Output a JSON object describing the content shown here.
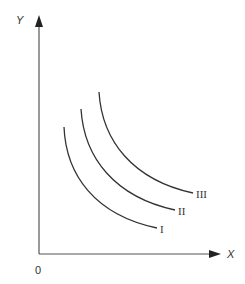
{
  "diagram": {
    "type": "indifference-curves",
    "axes": {
      "x_label": "X",
      "y_label": "Y",
      "origin_label": "0"
    },
    "curves": [
      {
        "id": "I",
        "label": "I"
      },
      {
        "id": "II",
        "label": "II"
      },
      {
        "id": "III",
        "label": "III"
      }
    ],
    "colors": {
      "line": "#333333",
      "axis": "#555555",
      "background": "#ffffff"
    }
  }
}
